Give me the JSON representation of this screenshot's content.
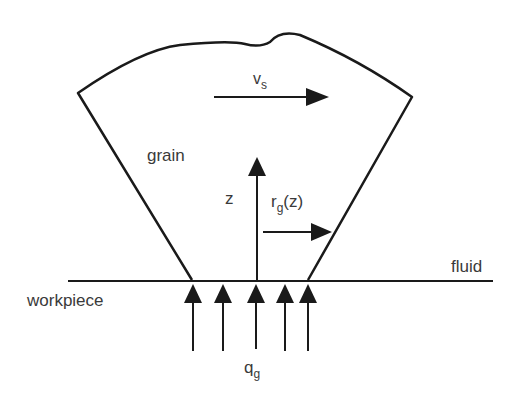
{
  "diagram": {
    "labels": {
      "vs_main": "v",
      "vs_sub": "s",
      "grain": "grain",
      "z": "z",
      "rg_main": "r",
      "rg_sub": "g",
      "rg_arg": "(z)",
      "fluid": "fluid",
      "workpiece": "workpiece",
      "qg_main": "q",
      "qg_sub": "g"
    },
    "colors": {
      "stroke": "#1a1a1a",
      "text": "#3a3a3a",
      "background": "#ffffff"
    }
  }
}
